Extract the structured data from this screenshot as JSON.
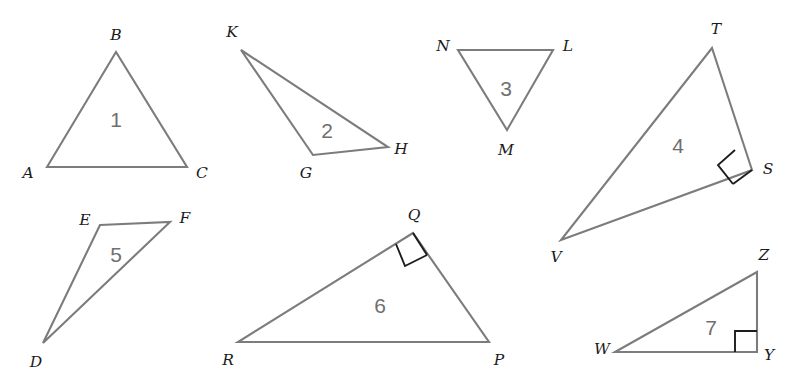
{
  "figure": {
    "width": 793,
    "height": 390,
    "background_color": "#ffffff",
    "stroke_color": "#7c7c7c",
    "label_color": "#1b1b1b",
    "number_color": "#6f6f6f",
    "right_angle_color": "#1d1d1d"
  },
  "triangles": [
    {
      "number": "1",
      "number_pos": {
        "x": 116,
        "y": 119
      },
      "vertices": [
        {
          "label": "A",
          "point": {
            "x": 47,
            "y": 167
          },
          "label_pos": {
            "x": 28,
            "y": 174
          }
        },
        {
          "label": "B",
          "point": {
            "x": 116,
            "y": 52
          },
          "label_pos": {
            "x": 116,
            "y": 36
          }
        },
        {
          "label": "C",
          "point": {
            "x": 187,
            "y": 167
          },
          "label_pos": {
            "x": 202,
            "y": 174
          }
        }
      ],
      "right_angle": null
    },
    {
      "number": "2",
      "number_pos": {
        "x": 327,
        "y": 130
      },
      "vertices": [
        {
          "label": "K",
          "point": {
            "x": 241,
            "y": 50
          },
          "label_pos": {
            "x": 232,
            "y": 33
          }
        },
        {
          "label": "G",
          "point": {
            "x": 313,
            "y": 155
          },
          "label_pos": {
            "x": 306,
            "y": 174
          }
        },
        {
          "label": "H",
          "point": {
            "x": 388,
            "y": 147
          },
          "label_pos": {
            "x": 401,
            "y": 150
          }
        }
      ],
      "right_angle": null
    },
    {
      "number": "3",
      "number_pos": {
        "x": 506,
        "y": 88
      },
      "vertices": [
        {
          "label": "N",
          "point": {
            "x": 458,
            "y": 50
          },
          "label_pos": {
            "x": 443,
            "y": 47
          }
        },
        {
          "label": "L",
          "point": {
            "x": 553,
            "y": 50
          },
          "label_pos": {
            "x": 568,
            "y": 47
          }
        },
        {
          "label": "M",
          "point": {
            "x": 507,
            "y": 130
          },
          "label_pos": {
            "x": 506,
            "y": 151
          }
        }
      ],
      "right_angle": null
    },
    {
      "number": "4",
      "number_pos": {
        "x": 678,
        "y": 145
      },
      "vertices": [
        {
          "label": "T",
          "point": {
            "x": 712,
            "y": 48
          },
          "label_pos": {
            "x": 716,
            "y": 30
          }
        },
        {
          "label": "S",
          "point": {
            "x": 752,
            "y": 170
          },
          "label_pos": {
            "x": 768,
            "y": 170
          }
        },
        {
          "label": "V",
          "point": {
            "x": 561,
            "y": 240
          },
          "label_pos": {
            "x": 556,
            "y": 258
          }
        }
      ],
      "right_angle": {
        "at": "S"
      }
    },
    {
      "number": "5",
      "number_pos": {
        "x": 116,
        "y": 254
      },
      "vertices": [
        {
          "label": "E",
          "point": {
            "x": 100,
            "y": 225
          },
          "label_pos": {
            "x": 85,
            "y": 221
          }
        },
        {
          "label": "F",
          "point": {
            "x": 170,
            "y": 222
          },
          "label_pos": {
            "x": 185,
            "y": 219
          }
        },
        {
          "label": "D",
          "point": {
            "x": 43,
            "y": 343
          },
          "label_pos": {
            "x": 36,
            "y": 363
          }
        }
      ],
      "right_angle": null
    },
    {
      "number": "6",
      "number_pos": {
        "x": 380,
        "y": 305
      },
      "vertices": [
        {
          "label": "Q",
          "point": {
            "x": 413,
            "y": 233
          },
          "label_pos": {
            "x": 414,
            "y": 216
          }
        },
        {
          "label": "R",
          "point": {
            "x": 238,
            "y": 342
          },
          "label_pos": {
            "x": 228,
            "y": 361
          }
        },
        {
          "label": "P",
          "point": {
            "x": 489,
            "y": 342
          },
          "label_pos": {
            "x": 499,
            "y": 361
          }
        }
      ],
      "right_angle": {
        "at": "Q"
      }
    },
    {
      "number": "7",
      "number_pos": {
        "x": 711,
        "y": 327
      },
      "vertices": [
        {
          "label": "Z",
          "point": {
            "x": 757,
            "y": 272
          },
          "label_pos": {
            "x": 764,
            "y": 256
          }
        },
        {
          "label": "W",
          "point": {
            "x": 615,
            "y": 352
          },
          "label_pos": {
            "x": 602,
            "y": 350
          }
        },
        {
          "label": "Y",
          "point": {
            "x": 757,
            "y": 352
          },
          "label_pos": {
            "x": 769,
            "y": 356
          }
        }
      ],
      "right_angle": {
        "at": "Y"
      }
    }
  ]
}
